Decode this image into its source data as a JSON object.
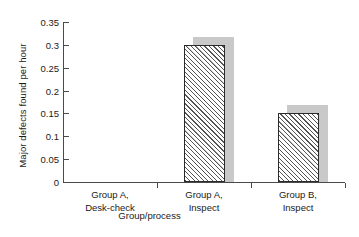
{
  "chart_data": {
    "type": "bar",
    "title": "",
    "subtitle": "",
    "xlabel": "Group/process",
    "ylabel": "Major defects found per hour",
    "categories": [
      "Group A,\nDesk-check",
      "Group A,\nInspect",
      "Group B,\nInspect"
    ],
    "category_lines": [
      [
        "Group A,",
        "Desk-check"
      ],
      [
        "Group A,",
        "Inspect"
      ],
      [
        "Group B,",
        "Inspect"
      ]
    ],
    "values": [
      0,
      0.3,
      0.15
    ],
    "ylim": [
      0,
      0.35
    ],
    "ytick_labels": [
      "0",
      "0.05",
      "0.1",
      "0.15",
      "0.2",
      "0.25",
      "0.3",
      "0.35"
    ],
    "ytick_values": [
      0,
      0.05,
      0.1,
      0.15,
      0.2,
      0.25,
      0.3,
      0.35
    ],
    "grid": false,
    "legend": "none",
    "bar_style": "diagonal-hatch-with-drop-shadow",
    "colors": {
      "bar_edge": "#2a2a2a",
      "bar_fill": "#ffffff",
      "hatch": "#555555",
      "shadow": "#c9c9c9",
      "axis": "#4a4a4a",
      "background": "#ffffff",
      "text": "#1a1a1a"
    }
  }
}
